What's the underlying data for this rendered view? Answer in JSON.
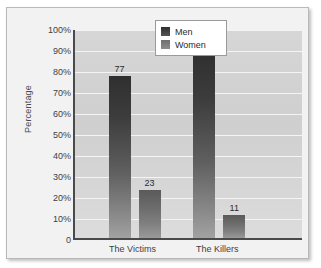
{
  "chart_data": {
    "type": "bar",
    "title": "",
    "xlabel": "",
    "ylabel": "Percentage",
    "categories": [
      "The Victims",
      "The Killers"
    ],
    "series": [
      {
        "name": "Men",
        "values": [
          77,
          89
        ],
        "color": "#3c3c3c"
      },
      {
        "name": "Women",
        "values": [
          23,
          11
        ],
        "color": "#7f7f7f"
      }
    ],
    "ylim": [
      0,
      100
    ],
    "yticks": [
      0,
      10,
      20,
      30,
      40,
      50,
      60,
      70,
      80,
      90,
      100
    ],
    "ytick_labels": [
      "0",
      "10%",
      "20%",
      "30%",
      "40%",
      "50%",
      "60%",
      "70%",
      "80%",
      "90%",
      "100%"
    ],
    "grid": true,
    "legend_position": "upper right",
    "data_labels": [
      "77",
      "23",
      "89",
      "11"
    ]
  },
  "legend": {
    "items": [
      {
        "label": "Men",
        "color": "#3c3c3c"
      },
      {
        "label": "Women",
        "color": "#7f7f7f"
      }
    ]
  },
  "axes": {
    "y_title": "Percentage",
    "y_tick_labels": [
      "100%",
      "90%",
      "80%",
      "70%",
      "60%",
      "50%",
      "40%",
      "30%",
      "20%",
      "10%",
      "0"
    ],
    "x_tick_labels": [
      "The Victims",
      "The Killers"
    ]
  },
  "bars": [
    {
      "group": "The Victims",
      "series": "Men",
      "value": 77,
      "label": "77"
    },
    {
      "group": "The Victims",
      "series": "Women",
      "value": 23,
      "label": "23"
    },
    {
      "group": "The Killers",
      "series": "Men",
      "value": 89,
      "label": "89"
    },
    {
      "group": "The Killers",
      "series": "Women",
      "value": 11,
      "label": "11"
    }
  ]
}
